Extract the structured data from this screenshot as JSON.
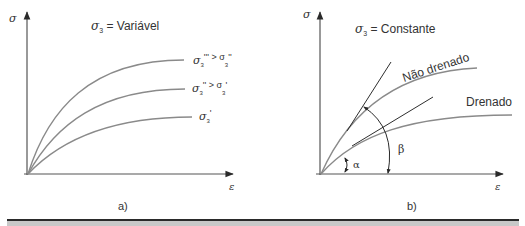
{
  "panels": [
    {
      "id": "a",
      "caption": "a)",
      "y_axis_label": "σ",
      "x_axis_label": "ε",
      "title_symbol": "σ",
      "title_subscript": "3",
      "title_text": " = Variável",
      "curves": [
        {
          "name": "sigma3-triple-prime",
          "label_main": "σ",
          "label_sub": "3",
          "label_rest": "''' > σ",
          "label_sub2": "3",
          "label_rest2": "''"
        },
        {
          "name": "sigma3-double-prime",
          "label_main": "σ",
          "label_sub": "3",
          "label_rest": "'' > σ",
          "label_sub2": "3",
          "label_rest2": "'"
        },
        {
          "name": "sigma3-prime",
          "label_main": "σ",
          "label_sub": "3",
          "label_rest": "'"
        }
      ]
    },
    {
      "id": "b",
      "caption": "b)",
      "y_axis_label": "σ",
      "x_axis_label": "ε",
      "title_symbol": "σ",
      "title_subscript": "3",
      "title_text": " = Constante",
      "curves": [
        {
          "name": "undrained",
          "label": "Não drenado"
        },
        {
          "name": "drained",
          "label": "Drenado"
        }
      ],
      "angles": {
        "alpha": "α",
        "beta": "β"
      }
    }
  ],
  "colors": {
    "axis": "#3a3a3a",
    "curve": "#8a8a8a",
    "tangent": "#2e2e2e",
    "text": "#333333",
    "rule": "#2a2a2a",
    "band": "#c8c8c8"
  }
}
